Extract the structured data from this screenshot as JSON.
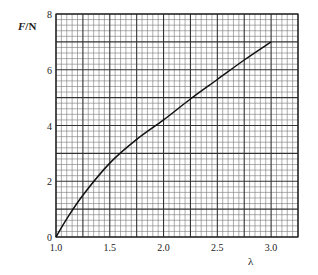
{
  "chart_data": {
    "type": "line",
    "title": "",
    "xlabel": "λ",
    "ylabel": "F/N",
    "xlim": [
      1.0,
      3.25
    ],
    "ylim": [
      0,
      8
    ],
    "xticks": [
      1.0,
      1.5,
      2.0,
      2.5,
      3.0
    ],
    "xtick_labels": [
      "1.0",
      "1.5",
      "2.0",
      "2.5",
      "3.0"
    ],
    "yticks": [
      0,
      2,
      4,
      6,
      8
    ],
    "ytick_labels": [
      "0",
      "2",
      "4",
      "6",
      "8"
    ],
    "grid": true,
    "grid_style": "graph paper: major every 0.25 in λ and 1 N in F, 5 minor subdivisions",
    "legend": null,
    "series": [
      {
        "name": "F vs λ",
        "x": [
          1.0,
          1.1,
          1.25,
          1.5,
          1.75,
          2.0,
          2.25,
          2.5,
          2.75,
          3.0
        ],
        "y": [
          0.0,
          0.65,
          1.5,
          2.65,
          3.5,
          4.2,
          4.95,
          5.65,
          6.35,
          7.0
        ]
      }
    ]
  },
  "axes": {
    "y_label_main": "F",
    "y_label_unit": "/N",
    "x_label": "λ"
  }
}
